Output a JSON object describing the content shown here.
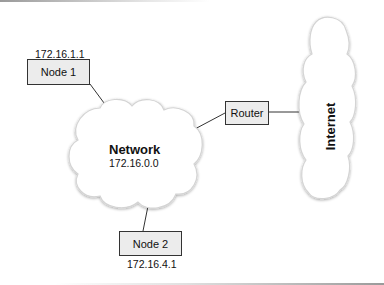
{
  "diagram": {
    "network": {
      "title": "Network",
      "address": "172.16.0.0"
    },
    "internet": {
      "label": "Internet"
    },
    "router": {
      "label": "Router"
    },
    "nodes": [
      {
        "label": "Node 1",
        "address": "172.16.1.1"
      },
      {
        "label": "Node 2",
        "address": "172.16.4.1"
      }
    ],
    "connections": [
      {
        "from": "Node 1",
        "to": "Network"
      },
      {
        "from": "Network",
        "to": "Router"
      },
      {
        "from": "Router",
        "to": "Internet"
      },
      {
        "from": "Network",
        "to": "Node 2"
      }
    ]
  },
  "colors": {
    "box_fill": "#ececec",
    "box_border": "#333333",
    "cloud_fill": "#ffffff",
    "cloud_outline": "#d0d0d0",
    "line": "#333333"
  }
}
